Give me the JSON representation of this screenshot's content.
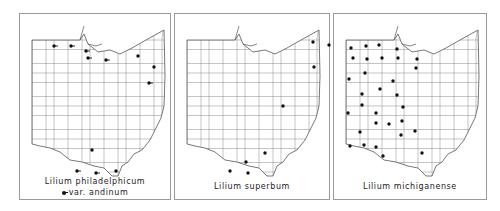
{
  "figure": {
    "panels": [
      {
        "id": "philadelphicum",
        "title": "Lilium philadelphicum",
        "legend": "var. andinum",
        "legend_symbol": "tailed-dot",
        "dots": [
          {
            "x": 30,
            "y": 30,
            "tailed": true
          },
          {
            "x": 47,
            "y": 30,
            "tailed": true
          },
          {
            "x": 62,
            "y": 35,
            "tailed": true
          },
          {
            "x": 64,
            "y": 42,
            "tailed": true
          },
          {
            "x": 82,
            "y": 44,
            "tailed": true
          },
          {
            "x": 114,
            "y": 40,
            "tailed": false
          },
          {
            "x": 130,
            "y": 51,
            "tailed": false
          },
          {
            "x": 125,
            "y": 67,
            "tailed": true
          },
          {
            "x": 68,
            "y": 134,
            "tailed": false
          },
          {
            "x": 53,
            "y": 155,
            "tailed": true
          },
          {
            "x": 72,
            "y": 157,
            "tailed": true
          },
          {
            "x": 92,
            "y": 155,
            "tailed": false
          }
        ]
      },
      {
        "id": "superbum",
        "title": "Lilium superbum",
        "legend": "",
        "dots": [
          {
            "x": 134,
            "y": 26
          },
          {
            "x": 150,
            "y": 29
          },
          {
            "x": 135,
            "y": 51
          },
          {
            "x": 104,
            "y": 90
          },
          {
            "x": 86,
            "y": 137
          },
          {
            "x": 67,
            "y": 146
          },
          {
            "x": 51,
            "y": 155
          },
          {
            "x": 69,
            "y": 157
          }
        ]
      },
      {
        "id": "michiganense",
        "title": "Lilium michiganense",
        "legend": "",
        "dots": [
          {
            "x": 13,
            "y": 32
          },
          {
            "x": 28,
            "y": 30
          },
          {
            "x": 41,
            "y": 29
          },
          {
            "x": 59,
            "y": 33
          },
          {
            "x": 15,
            "y": 42
          },
          {
            "x": 29,
            "y": 43
          },
          {
            "x": 44,
            "y": 42
          },
          {
            "x": 60,
            "y": 42
          },
          {
            "x": 79,
            "y": 43
          },
          {
            "x": 78,
            "y": 52
          },
          {
            "x": 27,
            "y": 57
          },
          {
            "x": 11,
            "y": 63
          },
          {
            "x": 55,
            "y": 65
          },
          {
            "x": 42,
            "y": 73
          },
          {
            "x": 24,
            "y": 78
          },
          {
            "x": 59,
            "y": 79
          },
          {
            "x": 24,
            "y": 89
          },
          {
            "x": 65,
            "y": 91
          },
          {
            "x": 10,
            "y": 97
          },
          {
            "x": 38,
            "y": 97
          },
          {
            "x": 64,
            "y": 105
          },
          {
            "x": 38,
            "y": 107
          },
          {
            "x": 51,
            "y": 108
          },
          {
            "x": 22,
            "y": 116
          },
          {
            "x": 77,
            "y": 115
          },
          {
            "x": 63,
            "y": 119
          },
          {
            "x": 12,
            "y": 130
          },
          {
            "x": 26,
            "y": 129
          },
          {
            "x": 38,
            "y": 131
          },
          {
            "x": 45,
            "y": 140
          },
          {
            "x": 84,
            "y": 137
          }
        ]
      }
    ]
  }
}
